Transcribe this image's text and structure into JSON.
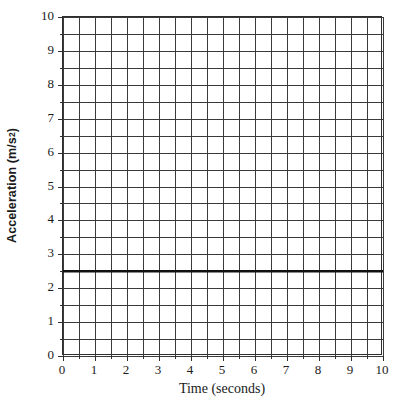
{
  "chart_data": {
    "type": "line",
    "title": "",
    "xlabel": "Time (seconds)",
    "ylabel_text": "Acceleration (m/s",
    "ylabel_sup": "2",
    "ylabel_tail": ")",
    "ylabel_full": "Acceleration (m/s2)",
    "xlim": [
      0,
      10
    ],
    "ylim": [
      0,
      10
    ],
    "x_major_step": 1,
    "y_major_step": 1,
    "x_minor_step": 0.5,
    "y_minor_step": 0.5,
    "grid": true,
    "grid_color": "#3a3a3a",
    "axis_color": "#2e2e2e",
    "legend": "none",
    "xticks": [
      0,
      1,
      2,
      3,
      4,
      5,
      6,
      7,
      8,
      9,
      10
    ],
    "xtick_labels": [
      "0",
      "1",
      "2",
      "3",
      "4",
      "5",
      "6",
      "7",
      "8",
      "9",
      "10"
    ],
    "yticks": [
      0,
      1,
      2,
      3,
      4,
      5,
      6,
      7,
      8,
      9,
      10
    ],
    "ytick_labels": [
      "0",
      "1",
      "2",
      "3",
      "4",
      "5",
      "6",
      "7",
      "8",
      "9",
      "10"
    ],
    "series": [
      {
        "name": "Acceleration",
        "color": "#111111",
        "linewidth": 2.6,
        "constant_value": 2.5,
        "x": [
          0,
          10
        ],
        "values": [
          2.5,
          2.5
        ]
      }
    ]
  }
}
